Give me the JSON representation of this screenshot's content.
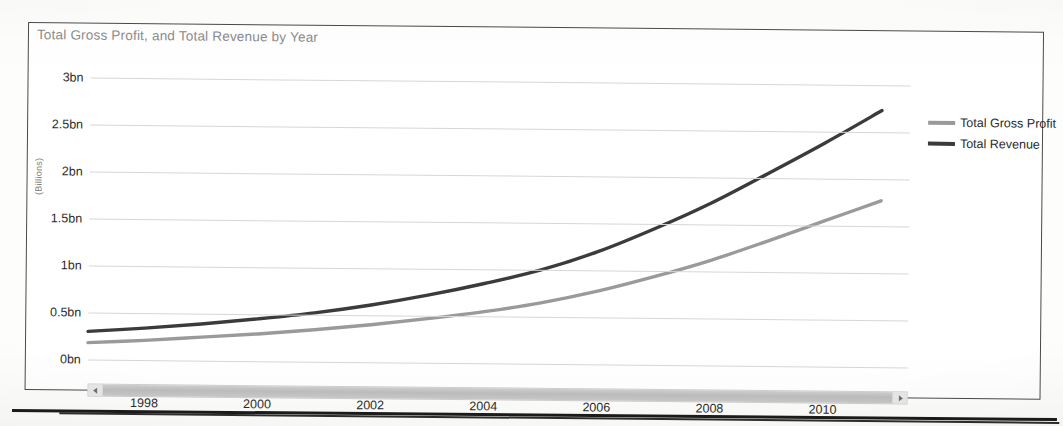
{
  "chart_data": {
    "type": "line",
    "title": "Total Gross Profit, and Total Revenue by Year",
    "xlabel": "",
    "ylabel": "(Billions)",
    "x": [
      1997,
      1998,
      1999,
      2000,
      2001,
      2002,
      2003,
      2004,
      2005,
      2006,
      2007,
      2008,
      2009,
      2010,
      2011
    ],
    "xtick_labels": [
      "1998",
      "2000",
      "2002",
      "2004",
      "2006",
      "2008",
      "2010"
    ],
    "xticks": [
      1998,
      2000,
      2002,
      2004,
      2006,
      2008,
      2010
    ],
    "ytick_labels": [
      "0bn",
      "0.5bn",
      "1bn",
      "1.5bn",
      "2bn",
      "2.5bn",
      "3bn"
    ],
    "yticks": [
      0,
      0.5,
      1,
      1.5,
      2,
      2.5,
      3
    ],
    "ylim": [
      0,
      3
    ],
    "xlim": [
      1997,
      2011.5
    ],
    "grid": true,
    "legend_position": "right",
    "series": [
      {
        "name": "Total Gross Profit",
        "color": "#9a9a9a",
        "values": [
          0.18,
          0.21,
          0.25,
          0.29,
          0.34,
          0.4,
          0.47,
          0.55,
          0.65,
          0.78,
          0.94,
          1.12,
          1.33,
          1.55,
          1.77
        ]
      },
      {
        "name": "Total Revenue",
        "color": "#3b3b3b",
        "values": [
          0.3,
          0.34,
          0.39,
          0.45,
          0.52,
          0.61,
          0.72,
          0.85,
          1.0,
          1.2,
          1.45,
          1.73,
          2.05,
          2.38,
          2.73
        ]
      }
    ]
  },
  "scrollbar": {
    "left_arrow": "scroll-left-arrow-icon",
    "right_arrow": "scroll-right-arrow-icon",
    "orientation": "horizontal"
  }
}
